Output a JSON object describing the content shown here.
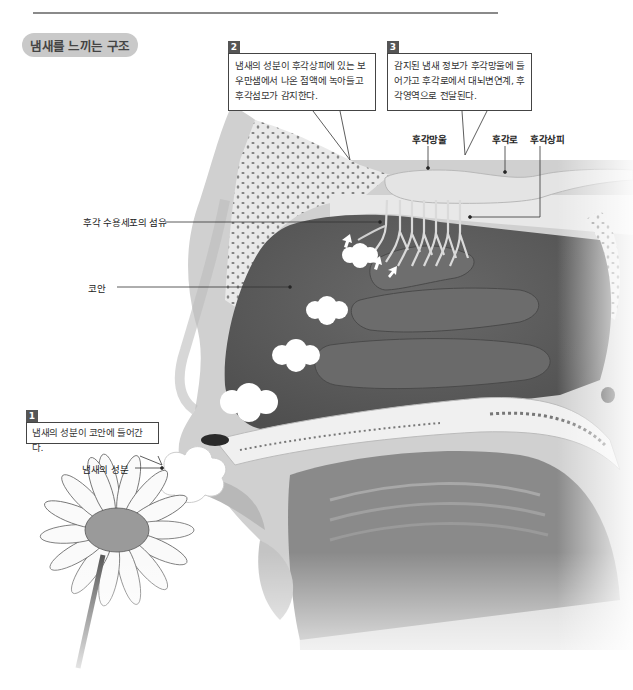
{
  "page": {
    "section_title": "냄새를 느끼는 구조"
  },
  "callouts": [
    {
      "number": "1",
      "text": "냄새의 성분이 코안에 들어간다."
    },
    {
      "number": "2",
      "text": "냄새의 성분이 후각상피에 있는 보우만샘에서 나온 점액에 녹아들고 후각섬모가 감지한다."
    },
    {
      "number": "3",
      "text": "감지된 냄새 정보가 후각망울에 들어가고 후각로에서 대뇌변연계, 후각영역으로 전달된다."
    }
  ],
  "labels": {
    "olfactory_bulb": "후각망울",
    "olfactory_tract": "후각로",
    "olfactory_epithelium": "후각상피",
    "receptor_fibers": "후각 수용세포의 섬유",
    "nasal_cavity": "코안",
    "odor_components": "냄새의 성분"
  },
  "colors": {
    "cavity": "#5a5a5a",
    "bone": "#e6e6e6",
    "skin": "#d2d2d2",
    "pill": "#c9c9c9",
    "rule": "#8a8a8a"
  }
}
